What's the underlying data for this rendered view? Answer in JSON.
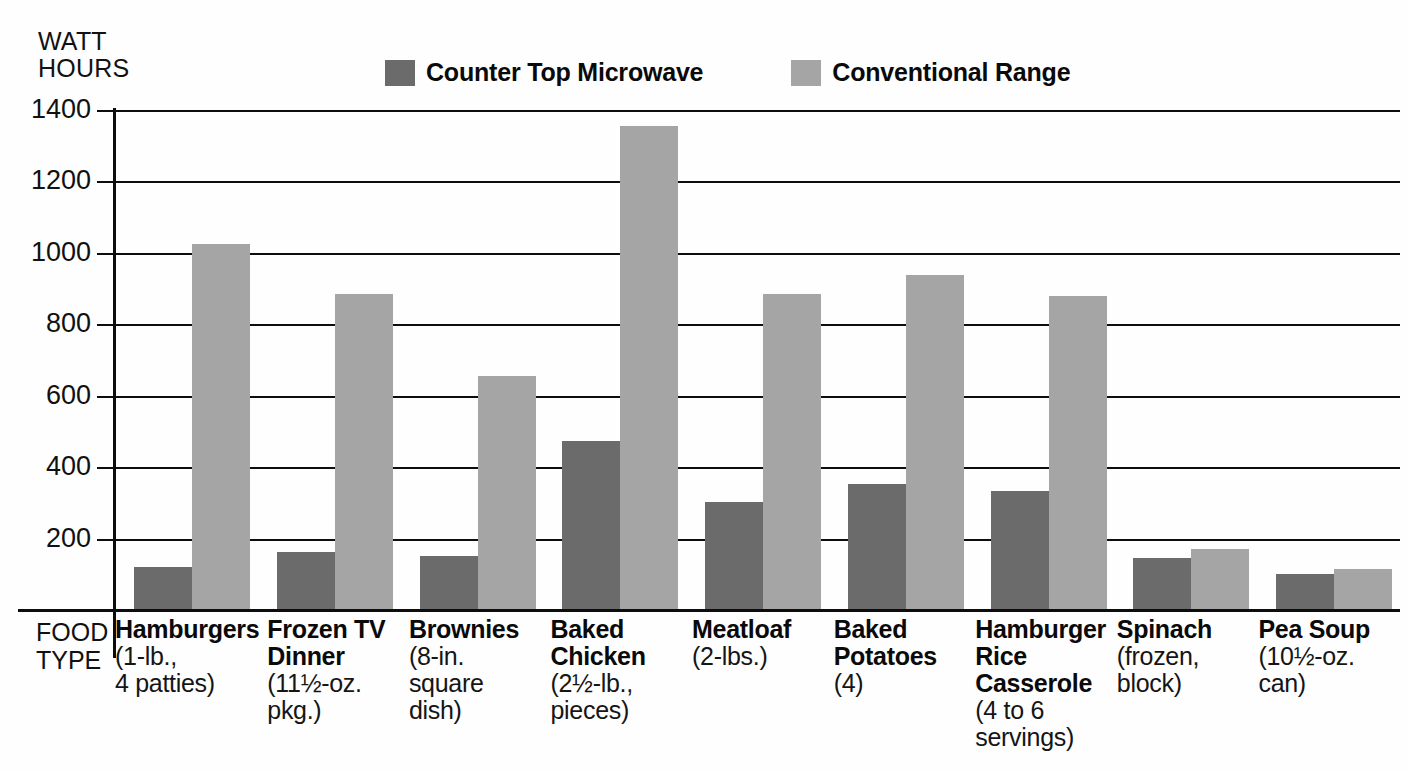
{
  "chart_data": {
    "type": "bar",
    "title": "",
    "ylabel": "WATT HOURS",
    "xlabel": "FOOD TYPE",
    "ylim": [
      0,
      1400
    ],
    "yticks": [
      200,
      400,
      600,
      800,
      1000,
      1200,
      1400
    ],
    "grid": true,
    "legend_position": "top",
    "categories": [
      "Hamburgers",
      "Frozen TV Dinner",
      "Brownies",
      "Baked Chicken",
      "Meatloaf",
      "Baked Potatoes",
      "Hamburger Rice Casserole",
      "Spinach",
      "Pea Soup"
    ],
    "category_notes": [
      "(1-lb.,\n4 patties)",
      "(11½-oz.\npkg.)",
      "(8-in.\nsquare\ndish)",
      "(2½-lb.,\npieces)",
      "(2-lbs.)",
      "(4)",
      "(4 to 6\nservings)",
      "(frozen,\nblock)",
      "(10½-oz.\ncan)"
    ],
    "series": [
      {
        "name": "Counter Top Microwave",
        "color": "#6b6b6b",
        "values": [
          120,
          162,
          152,
          473,
          303,
          352,
          333,
          145,
          100
        ]
      },
      {
        "name": "Conventional Range",
        "color": "#a5a5a5",
        "values": [
          1025,
          885,
          655,
          1355,
          885,
          938,
          880,
          170,
          115
        ]
      }
    ]
  },
  "axes": {
    "y_title": "WATT\nHOURS",
    "x_title": "FOOD\nTYPE"
  },
  "colors": {
    "microwave": "#6b6b6b",
    "range": "#a5a5a5",
    "axis": "#0d0d0d",
    "background": "#fefefe"
  }
}
